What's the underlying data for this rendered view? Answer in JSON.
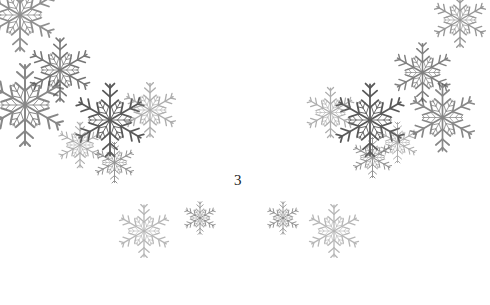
{
  "page": {
    "page_number": "3"
  },
  "decoration": {
    "motif": "snowflake-icon",
    "color": "#555555"
  }
}
